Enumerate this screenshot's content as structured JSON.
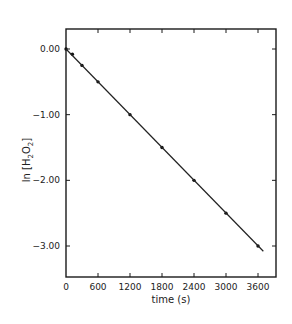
{
  "chart_data": {
    "type": "line",
    "title": "",
    "xlabel": "time (s)",
    "ylabel": "ln [H2O2]",
    "ylabel_parts": {
      "prefix": "ln [H",
      "sub1": "2",
      "mid": "O",
      "sub2": "2",
      "suffix": "]"
    },
    "xlim": [
      0,
      3900
    ],
    "ylim": [
      -3.5,
      0.3
    ],
    "grid": false,
    "legend": null,
    "x_ticks": [
      0,
      600,
      1200,
      1800,
      2400,
      3000,
      3600
    ],
    "x_tick_labels": [
      "0",
      "600",
      "1200",
      "1800",
      "2400",
      "3000",
      "3600"
    ],
    "y_ticks": [
      0.0,
      -1.0,
      -2.0,
      -3.0
    ],
    "y_tick_labels": [
      "0.00",
      "-1.00",
      "-2.00",
      "-3.00"
    ],
    "series": [
      {
        "name": "measured",
        "style": "points",
        "x": [
          0,
          120,
          300,
          600,
          1200,
          1800,
          2400,
          3000,
          3600
        ],
        "y": [
          0.0,
          -0.08,
          -0.25,
          -0.5,
          -1.0,
          -1.5,
          -2.0,
          -2.5,
          -3.0
        ]
      },
      {
        "name": "linear fit",
        "style": "line",
        "x": [
          0,
          3700
        ],
        "y": [
          0.0,
          -3.08
        ]
      }
    ]
  }
}
